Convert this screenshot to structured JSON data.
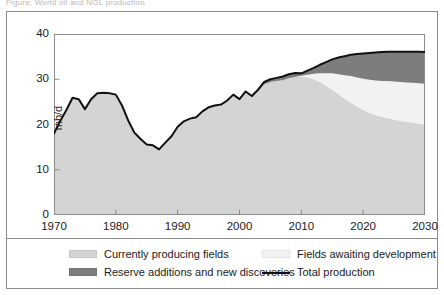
{
  "figure": {
    "caption_partial": "Figure: World oil and NGL production"
  },
  "chart_data": {
    "type": "area",
    "stacking": "stacked",
    "title": "",
    "xlabel": "",
    "ylabel": "mb/d",
    "xlim": [
      1970,
      2030
    ],
    "ylim": [
      0,
      40
    ],
    "xticks": [
      1970,
      1980,
      1990,
      2000,
      2010,
      2020,
      2030
    ],
    "yticks": [
      0,
      10,
      20,
      30,
      40
    ],
    "grid": false,
    "legend_position": "below-plot",
    "colors": {
      "currently_producing_fields": "#d4d4d4",
      "fields_awaiting_development": "#f2f2f2",
      "reserve_additions_and_new_discoveries": "#7d7d7d",
      "total_production_line": "#111111",
      "axis": "#8c8c8c",
      "frame": "#8c8c8c"
    },
    "x": [
      1970,
      1971,
      1972,
      1973,
      1974,
      1975,
      1976,
      1977,
      1978,
      1979,
      1980,
      1981,
      1982,
      1983,
      1984,
      1985,
      1986,
      1987,
      1988,
      1989,
      1990,
      1991,
      1992,
      1993,
      1994,
      1995,
      1996,
      1997,
      1998,
      1999,
      2000,
      2001,
      2002,
      2003,
      2004,
      2005,
      2006,
      2007,
      2008,
      2009,
      2010,
      2011,
      2012,
      2013,
      2014,
      2015,
      2016,
      2017,
      2018,
      2019,
      2020,
      2021,
      2022,
      2023,
      2024,
      2025,
      2026,
      2027,
      2028,
      2029,
      2030
    ],
    "series": [
      {
        "name": "Currently producing fields",
        "key": "currently_producing_fields",
        "color": "#d4d4d4",
        "values": [
          18.0,
          20.8,
          23.2,
          25.9,
          25.6,
          23.4,
          25.6,
          26.9,
          27.0,
          26.9,
          26.6,
          24.2,
          20.9,
          18.2,
          16.8,
          15.6,
          15.4,
          14.5,
          16.0,
          17.4,
          19.5,
          20.7,
          21.3,
          21.6,
          22.9,
          23.8,
          24.2,
          24.4,
          25.3,
          26.6,
          25.5,
          27.1,
          26.0,
          27.3,
          28.9,
          29.4,
          29.6,
          29.8,
          30.2,
          30.5,
          30.6,
          30.4,
          30.0,
          29.4,
          28.6,
          27.7,
          26.7,
          25.7,
          24.8,
          24.0,
          23.2,
          22.6,
          22.1,
          21.7,
          21.4,
          21.1,
          20.8,
          20.6,
          20.4,
          20.2,
          20.0
        ]
      },
      {
        "name": "Fields awaiting development",
        "key": "fields_awaiting_development",
        "color": "#f2f2f2",
        "values": [
          0,
          0,
          0,
          0,
          0,
          0,
          0,
          0,
          0,
          0,
          0,
          0,
          0,
          0,
          0,
          0,
          0,
          0,
          0,
          0,
          0,
          0,
          0,
          0,
          0,
          0,
          0,
          0,
          0,
          0,
          0,
          0,
          0,
          0,
          0,
          0,
          0,
          0,
          0,
          0,
          0.2,
          0.6,
          1.2,
          1.9,
          2.7,
          3.6,
          4.4,
          5.2,
          5.9,
          6.4,
          6.9,
          7.3,
          7.6,
          7.9,
          8.2,
          8.4,
          8.6,
          8.7,
          8.8,
          8.9,
          9.0
        ]
      },
      {
        "name": "Reserve additions and new discoveries",
        "key": "reserve_additions_and_new_discoveries",
        "color": "#7d7d7d",
        "values": [
          0,
          0,
          0,
          0,
          0,
          0,
          0,
          0,
          0,
          0,
          0,
          0,
          0,
          0,
          0,
          0,
          0,
          0,
          0,
          0,
          0,
          0,
          0,
          0,
          0,
          0,
          0,
          0,
          0,
          0,
          0.1,
          0.2,
          0.3,
          0.4,
          0.5,
          0.6,
          0.7,
          0.8,
          0.9,
          0.9,
          0.5,
          0.9,
          1.3,
          1.9,
          2.5,
          3.1,
          3.7,
          4.2,
          4.7,
          5.2,
          5.6,
          5.9,
          6.2,
          6.4,
          6.5,
          6.6,
          6.7,
          6.8,
          6.9,
          6.95,
          7.0
        ]
      }
    ],
    "total_production": {
      "name": "Total production",
      "values": [
        18.0,
        20.8,
        23.2,
        25.9,
        25.6,
        23.4,
        25.6,
        26.9,
        27.0,
        26.9,
        26.6,
        24.2,
        20.9,
        18.2,
        16.8,
        15.6,
        15.4,
        14.5,
        16.0,
        17.4,
        19.5,
        20.7,
        21.3,
        21.6,
        22.9,
        23.8,
        24.2,
        24.4,
        25.3,
        26.6,
        25.6,
        27.3,
        26.3,
        27.7,
        29.4,
        30.0,
        30.3,
        30.6,
        31.1,
        31.4,
        31.3,
        31.9,
        32.5,
        33.2,
        33.8,
        34.4,
        34.8,
        35.1,
        35.4,
        35.6,
        35.7,
        35.8,
        35.9,
        36.0,
        36.1,
        36.1,
        36.1,
        36.1,
        36.1,
        36.05,
        36.0
      ]
    }
  },
  "legend": {
    "items": [
      {
        "label": "Currently producing fields",
        "marker": "swatch",
        "color": "#d4d4d4"
      },
      {
        "label": "Fields awaiting development",
        "marker": "swatch",
        "color": "#f2f2f2"
      },
      {
        "label": "Reserve additions and new discoveries",
        "marker": "swatch",
        "color": "#7d7d7d"
      },
      {
        "label": "Total production",
        "marker": "line",
        "color": "#111111"
      }
    ]
  }
}
